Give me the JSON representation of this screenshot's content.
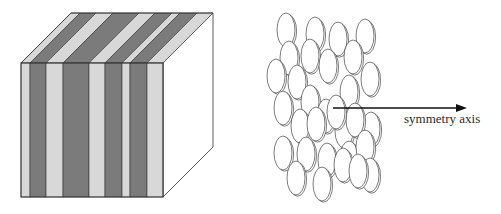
{
  "figure": {
    "left_panel": {
      "description": "lamellar block with alternating stripes",
      "colors": {
        "dark_stripe": "#7b7b7b",
        "light_stripe": "#d8d8d8",
        "side_face": "#ffffff",
        "edge": "#333333"
      },
      "front_face": {
        "x0": 21,
        "y0": 63,
        "x1": 163,
        "y1": 197
      },
      "depth_offset": {
        "dx": 50,
        "dy": -50
      },
      "stripe_boundaries": [
        21,
        30,
        46,
        63,
        89,
        105,
        122,
        130,
        147,
        163
      ],
      "stripe_types": [
        "light",
        "dark",
        "light",
        "dark",
        "light",
        "dark",
        "light",
        "dark",
        "light"
      ]
    },
    "right_panel": {
      "description": "stack of disks with symmetry axis",
      "disk": {
        "rx": 9,
        "ry": 17,
        "stroke": "#444444"
      },
      "disks": [
        [
          286,
          30
        ],
        [
          315,
          34
        ],
        [
          338,
          39
        ],
        [
          365,
          36
        ],
        [
          289,
          58
        ],
        [
          310,
          56
        ],
        [
          328,
          66
        ],
        [
          353,
          57
        ],
        [
          276,
          76
        ],
        [
          297,
          82
        ],
        [
          370,
          79
        ],
        [
          349,
          92
        ],
        [
          310,
          102
        ],
        [
          283,
          108
        ],
        [
          326,
          116
        ],
        [
          300,
          126
        ],
        [
          316,
          124
        ],
        [
          344,
          131
        ],
        [
          371,
          129
        ],
        [
          355,
          120
        ],
        [
          336,
          112
        ],
        [
          283,
          153
        ],
        [
          306,
          154
        ],
        [
          327,
          160
        ],
        [
          349,
          158
        ],
        [
          365,
          147
        ],
        [
          343,
          165
        ],
        [
          296,
          178
        ],
        [
          322,
          184
        ],
        [
          370,
          175
        ],
        [
          358,
          171
        ]
      ],
      "arrow": {
        "x1": 333,
        "y1": 108,
        "x2": 467,
        "y2": 108,
        "color": "#111111"
      },
      "axis_label": "symmetry axis"
    }
  }
}
